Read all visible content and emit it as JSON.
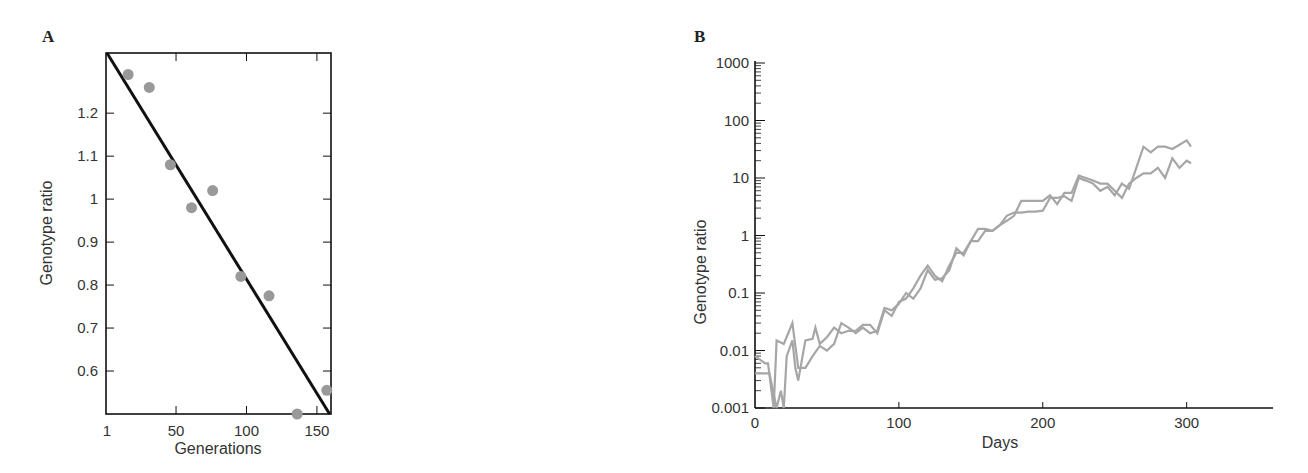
{
  "chart_data": [
    {
      "panel": "A",
      "type": "scatter",
      "title": "",
      "xlabel": "Generations",
      "ylabel": "Genotype ratio",
      "xlim": [
        1,
        160
      ],
      "ylim": [
        0.5,
        1.34
      ],
      "xticks": [
        1,
        50,
        100,
        150
      ],
      "xtick_labels": [
        "1",
        "50",
        "100",
        "150"
      ],
      "yticks": [
        0.6,
        0.7,
        0.8,
        0.9,
        1.0,
        1.1,
        1.2
      ],
      "ytick_labels": [
        "0.6",
        "0.7",
        "0.8",
        "0.9",
        "1",
        "1.1",
        "1.2"
      ],
      "grid": false,
      "points": [
        {
          "x": 16,
          "y": 1.29
        },
        {
          "x": 31,
          "y": 1.26
        },
        {
          "x": 46,
          "y": 1.08
        },
        {
          "x": 61,
          "y": 0.98
        },
        {
          "x": 76,
          "y": 1.02
        },
        {
          "x": 96,
          "y": 0.82
        },
        {
          "x": 116,
          "y": 0.775
        },
        {
          "x": 136,
          "y": 0.5
        },
        {
          "x": 157,
          "y": 0.555
        }
      ],
      "fit_line": {
        "x": [
          1,
          159
        ],
        "y": [
          1.34,
          0.5
        ]
      },
      "colors": {
        "points": "#999999",
        "line": "#111111",
        "frame": "#111111"
      }
    },
    {
      "panel": "B",
      "type": "line",
      "title": "",
      "xlabel": "Days",
      "ylabel": "Genotype ratio",
      "xscale": "linear",
      "yscale": "log",
      "xlim": [
        0,
        360
      ],
      "ylim": [
        0.001,
        1000
      ],
      "xticks": [
        0,
        100,
        200,
        300
      ],
      "xtick_labels": [
        "0",
        "100",
        "200",
        "300"
      ],
      "yticks": [
        0.001,
        0.01,
        0.1,
        1,
        10,
        100,
        1000
      ],
      "ytick_labels": [
        "0.001",
        "0.01",
        "0.1",
        "1",
        "10",
        "100",
        "1000"
      ],
      "grid": false,
      "series": [
        {
          "name": "replicate 1",
          "x": [
            0,
            7,
            9,
            13,
            15,
            20,
            26,
            30,
            35,
            40,
            45,
            50,
            55,
            60,
            65,
            70,
            75,
            80,
            85,
            90,
            95,
            100,
            105,
            110,
            115,
            120,
            125,
            130,
            135,
            140,
            145,
            150,
            155,
            160,
            165,
            170,
            175,
            180,
            185,
            190,
            195,
            200,
            205,
            210,
            215,
            220,
            225,
            230,
            235,
            240,
            245,
            250,
            255,
            260,
            265,
            270,
            275,
            280,
            285,
            290,
            295,
            300,
            303
          ],
          "y": [
            0.008,
            0.006,
            0.006,
            0.001,
            0.015,
            0.013,
            0.03,
            0.005,
            0.005,
            0.008,
            0.012,
            0.01,
            0.013,
            0.03,
            0.025,
            0.02,
            0.025,
            0.02,
            0.022,
            0.055,
            0.05,
            0.065,
            0.1,
            0.08,
            0.12,
            0.25,
            0.17,
            0.18,
            0.25,
            0.6,
            0.45,
            0.8,
            1.3,
            1.3,
            1.2,
            1.5,
            2.2,
            2.5,
            2.5,
            2.6,
            2.6,
            2.7,
            4.5,
            4.5,
            4.8,
            4.0,
            10,
            9,
            8,
            6,
            7,
            5,
            8,
            6.5,
            15,
            35,
            28,
            35,
            35,
            32,
            38,
            45,
            35
          ]
        },
        {
          "name": "replicate 2",
          "x": [
            0,
            5,
            10,
            15,
            18,
            20,
            22,
            26,
            28,
            30,
            35,
            40,
            42,
            45,
            50,
            55,
            60,
            65,
            70,
            75,
            80,
            85,
            90,
            95,
            100,
            105,
            110,
            115,
            120,
            125,
            130,
            135,
            140,
            145,
            150,
            155,
            160,
            165,
            170,
            175,
            180,
            185,
            190,
            195,
            200,
            205,
            210,
            215,
            220,
            225,
            230,
            235,
            240,
            245,
            250,
            255,
            260,
            265,
            270,
            275,
            280,
            285,
            290,
            295,
            300,
            303
          ],
          "y": [
            0.004,
            0.004,
            0.004,
            0.001,
            0.002,
            0.001,
            0.008,
            0.015,
            0.005,
            0.003,
            0.015,
            0.016,
            0.025,
            0.013,
            0.017,
            0.025,
            0.02,
            0.022,
            0.022,
            0.028,
            0.028,
            0.02,
            0.05,
            0.04,
            0.07,
            0.08,
            0.12,
            0.2,
            0.3,
            0.2,
            0.16,
            0.3,
            0.5,
            0.5,
            0.8,
            0.8,
            1.2,
            1.2,
            1.5,
            1.8,
            2.2,
            4.0,
            4.0,
            4.0,
            4.0,
            5.0,
            3.5,
            5.5,
            5.5,
            11,
            10,
            9,
            8,
            8,
            6,
            4.5,
            8,
            10,
            12,
            12,
            15,
            10,
            22,
            15,
            20,
            18
          ]
        }
      ],
      "colors": {
        "lines": "#a6a6a6",
        "axes": "#111111"
      }
    }
  ],
  "panels": {
    "a_label": "A",
    "b_label": "B"
  }
}
